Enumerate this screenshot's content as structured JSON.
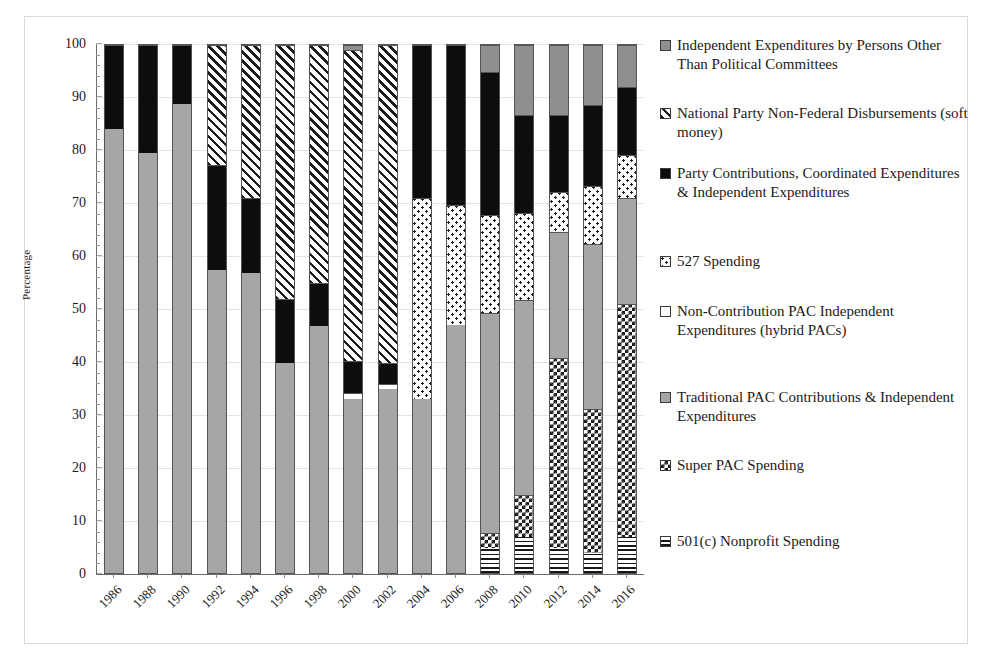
{
  "axes": {
    "ylabel": "Percentage",
    "yticks": [
      "0",
      "10",
      "20",
      "30",
      "40",
      "50",
      "60",
      "70",
      "80",
      "90",
      "100"
    ],
    "ylim": [
      0,
      100
    ],
    "xticks": [
      "1986",
      "1988",
      "1990",
      "1992",
      "1994",
      "1996",
      "1998",
      "2000",
      "2002",
      "2004",
      "2006",
      "2008",
      "2010",
      "2012",
      "2014",
      "2016"
    ]
  },
  "legend": [
    {
      "label": "Independent Expenditures by Persons Other Than Political Committees",
      "pattern": "solid-grey",
      "color": "#8f8f8f"
    },
    {
      "label": "National Party Non-Federal Disbursements (soft money)",
      "pattern": "diagonal-stripe",
      "color": "#1c1c1c"
    },
    {
      "label": "Party Contributions, Coordinated Expenditures & Independent Expenditures",
      "pattern": "solid-black",
      "color": "#0d0d0d"
    },
    {
      "label": "527 Spending",
      "pattern": "speckle",
      "color": "#1c1c1c"
    },
    {
      "label": "Non-Contribution PAC Independent Expenditures (hybrid PACs)",
      "pattern": "white",
      "color": "#ffffff"
    },
    {
      "label": "Traditional PAC Contributions & Independent Expenditures",
      "pattern": "light-grey",
      "color": "#a6a6a6"
    },
    {
      "label": "Super PAC Spending",
      "pattern": "checkerboard",
      "color": "#161616"
    },
    {
      "label": "501(c) Nonprofit Spending",
      "pattern": "horizontal-stripe",
      "color": "#181818"
    }
  ],
  "chart_data": {
    "type": "bar",
    "title": "",
    "xlabel": "",
    "ylabel": "Percentage",
    "ylim": [
      0,
      100
    ],
    "grid": true,
    "stacked": true,
    "legend_position": "right",
    "categories": [
      "1986",
      "1988",
      "1990",
      "1992",
      "1994",
      "1996",
      "1998",
      "2000",
      "2002",
      "2004",
      "2006",
      "2008",
      "2010",
      "2012",
      "2014",
      "2016"
    ],
    "series": [
      {
        "name": "501(c) Nonprofit Spending",
        "key": "f-501",
        "values": [
          0,
          0,
          0,
          0,
          0,
          0,
          0,
          0,
          0,
          0,
          0,
          5.0,
          7.0,
          5.0,
          4.0,
          7.0
        ]
      },
      {
        "name": "Super PAC Spending",
        "key": "f-super",
        "values": [
          0,
          0,
          0,
          0,
          0,
          0,
          0,
          0,
          0,
          0,
          0,
          2.8,
          8.0,
          35.8,
          27.2,
          44.0
        ]
      },
      {
        "name": "Traditional PAC Contributions & Independent Expenditures",
        "key": "f-trad",
        "values": [
          84.0,
          79.5,
          88.7,
          57.3,
          56.8,
          39.8,
          46.8,
          33.0,
          35.0,
          33.0,
          47.0,
          41.5,
          36.7,
          23.8,
          31.0,
          20.0
        ]
      },
      {
        "name": "Non-Contribution PAC Independent Expenditures (hybrid PACs)",
        "key": "f-hybrid",
        "values": [
          0,
          0,
          0,
          0,
          0,
          0,
          0,
          1.2,
          0.8,
          0,
          0,
          0,
          0,
          0,
          0,
          0
        ]
      },
      {
        "name": "527 Spending",
        "key": "f-527",
        "values": [
          0,
          0,
          0,
          0,
          0,
          0,
          0,
          0,
          0,
          38.0,
          22.6,
          18.5,
          16.5,
          7.5,
          11.0,
          8.0
        ]
      },
      {
        "name": "Party Contributions, Coordinated Expenditures & Independent Expenditures",
        "key": "f-party",
        "values": [
          16.0,
          20.5,
          11.3,
          19.8,
          14.1,
          12.1,
          8.2,
          6.0,
          4.0,
          29.0,
          30.4,
          26.9,
          18.4,
          14.6,
          15.3,
          12.8
        ]
      },
      {
        "name": "National Party Non-Federal Disbursements (soft money)",
        "key": "f-soft",
        "values": [
          0,
          0,
          0,
          22.9,
          29.1,
          48.1,
          45.0,
          58.6,
          60.2,
          0,
          0,
          0,
          0,
          0,
          0,
          0
        ]
      },
      {
        "name": "Independent Expenditures by Persons Other Than Political Committees",
        "key": "f-indep",
        "values": [
          0,
          0,
          0,
          0,
          0,
          0,
          0,
          1.2,
          0,
          0,
          0,
          5.3,
          13.4,
          13.3,
          11.5,
          8.2
        ]
      }
    ],
    "stack_order_bottom_to_top": [
      "501(c) Nonprofit Spending",
      "Super PAC Spending",
      "Traditional PAC Contributions & Independent Expenditures",
      "Non-Contribution PAC Independent Expenditures (hybrid PACs)",
      "527 Spending",
      "Party Contributions, Coordinated Expenditures & Independent Expenditures",
      "National Party Non-Federal Disbursements (soft money)",
      "Independent Expenditures by Persons Other Than Political Committees"
    ]
  }
}
